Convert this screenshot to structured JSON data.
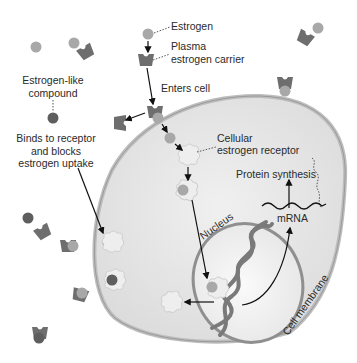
{
  "diagram": {
    "labels": {
      "estrogen": "Estrogen",
      "plasma_carrier_line1": "Plasma",
      "plasma_carrier_line2": "estrogen carrier",
      "enters_cell": "Enters cell",
      "estrogen_like_line1": "Estrogen-like",
      "estrogen_like_line2": "compound",
      "binds_line1": "Binds to receptor",
      "binds_line2": "and blocks",
      "binds_line3": "estrogen uptake",
      "cellular_receptor_line1": "Cellular",
      "cellular_receptor_line2": "estrogen receptor",
      "protein_synthesis": "Protein synthesis",
      "mrna": "mRNA",
      "nucleus": "Nucleus",
      "cell_membrane": "Cell membrane"
    },
    "colors": {
      "estrogen": "#a8a8a8",
      "estrogen_like": "#5e5e5e",
      "carrier": "#6e6e6e",
      "receptor": "#eeeeee",
      "cytoplasm": "#e2e2e2",
      "membrane": "#bdbdbd",
      "nucleus_fill": "#f6f6f6",
      "nucleus_ring": "#8f8f8f",
      "dna": "#7a7a7a",
      "arrow": "#111111"
    }
  }
}
